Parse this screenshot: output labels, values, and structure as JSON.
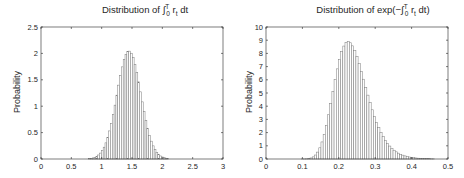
{
  "left": {
    "title_prefix": "Distribution of ",
    "title_integral": "∫",
    "title_sup": "T",
    "title_sub": "0",
    "title_body": " r",
    "title_body_sub": "t",
    "title_suffix": " dt",
    "ylabel": "Probability",
    "xticks": [
      "0",
      "0.5",
      "1",
      "1.5",
      "2",
      "2.5",
      "3"
    ],
    "yticks": [
      "0",
      "0.5",
      "1",
      "1.5",
      "2",
      "2.5"
    ]
  },
  "right": {
    "title_prefix": "Distribution of exp(−",
    "title_integral": "∫",
    "title_sup": "T",
    "title_sub": "0",
    "title_body": " r",
    "title_body_sub": "t",
    "title_suffix": " dt)",
    "ylabel": "Probability",
    "xticks": [
      "0",
      "0.1",
      "0.2",
      "0.3",
      "0.4",
      "0.5"
    ],
    "yticks": [
      "0",
      "1",
      "2",
      "3",
      "4",
      "5",
      "6",
      "7",
      "8",
      "9",
      "10"
    ]
  },
  "colors": {
    "bar_fill": "#ffffff",
    "bar_edge": "#7a7a7a",
    "axis": "#262626",
    "text": "#262626"
  },
  "chart_data": [
    {
      "type": "bar",
      "title": "Distribution of ∫_0^T r_t dt",
      "xlabel": "",
      "ylabel": "Probability",
      "xlim": [
        0,
        3
      ],
      "ylim": [
        0,
        2.5
      ],
      "xticks": [
        0,
        0.5,
        1,
        1.5,
        2,
        2.5,
        3
      ],
      "yticks": [
        0,
        0.5,
        1,
        1.5,
        2,
        2.5
      ],
      "grid": false,
      "legend": null,
      "bin_width": 0.03,
      "x": [
        0.8,
        0.83,
        0.86,
        0.89,
        0.92,
        0.95,
        0.98,
        1.01,
        1.04,
        1.07,
        1.1,
        1.13,
        1.16,
        1.19,
        1.22,
        1.25,
        1.28,
        1.31,
        1.34,
        1.37,
        1.4,
        1.43,
        1.46,
        1.49,
        1.52,
        1.55,
        1.58,
        1.61,
        1.64,
        1.67,
        1.7,
        1.73,
        1.76,
        1.79,
        1.82,
        1.85,
        1.88,
        1.91,
        1.94,
        1.97,
        2.0,
        2.03,
        2.06,
        2.09
      ],
      "values": [
        0.008,
        0.013,
        0.021,
        0.033,
        0.051,
        0.076,
        0.112,
        0.16,
        0.224,
        0.306,
        0.408,
        0.532,
        0.677,
        0.841,
        1.02,
        1.209,
        1.399,
        1.581,
        1.745,
        1.881,
        1.98,
        2.035,
        2.043,
        2.003,
        1.918,
        1.794,
        1.638,
        1.461,
        1.272,
        1.082,
        0.899,
        0.729,
        0.578,
        0.447,
        0.338,
        0.249,
        0.18,
        0.126,
        0.087,
        0.058,
        0.038,
        0.024,
        0.015,
        0.009
      ]
    },
    {
      "type": "bar",
      "title": "Distribution of exp(−∫_0^T r_t dt)",
      "xlabel": "",
      "ylabel": "Probability",
      "xlim": [
        0,
        0.5
      ],
      "ylim": [
        0,
        10
      ],
      "xticks": [
        0,
        0.1,
        0.2,
        0.3,
        0.4,
        0.5
      ],
      "yticks": [
        0,
        1,
        2,
        3,
        4,
        5,
        6,
        7,
        8,
        9,
        10
      ],
      "grid": false,
      "legend": null,
      "bin_width": 0.006,
      "x": [
        0.1,
        0.106,
        0.112,
        0.118,
        0.124,
        0.13,
        0.136,
        0.142,
        0.148,
        0.154,
        0.16,
        0.166,
        0.172,
        0.178,
        0.184,
        0.19,
        0.196,
        0.202,
        0.208,
        0.214,
        0.22,
        0.226,
        0.232,
        0.238,
        0.244,
        0.25,
        0.256,
        0.262,
        0.268,
        0.274,
        0.28,
        0.286,
        0.292,
        0.298,
        0.304,
        0.31,
        0.316,
        0.322,
        0.328,
        0.334,
        0.34,
        0.346,
        0.352,
        0.358,
        0.364,
        0.37,
        0.376,
        0.382,
        0.388,
        0.394,
        0.4,
        0.406,
        0.412,
        0.418,
        0.424,
        0.43,
        0.436,
        0.442,
        0.448,
        0.454,
        0.46
      ],
      "values": [
        0.001,
        0.005,
        0.014,
        0.035,
        0.079,
        0.161,
        0.302,
        0.523,
        0.849,
        1.293,
        1.863,
        2.557,
        3.352,
        4.222,
        5.12,
        6.005,
        6.829,
        7.549,
        8.134,
        8.557,
        8.81,
        8.89,
        8.805,
        8.573,
        8.216,
        7.758,
        7.228,
        6.648,
        6.045,
        5.434,
        4.839,
        4.267,
        3.728,
        3.232,
        2.778,
        2.373,
        2.013,
        1.696,
        1.421,
        1.185,
        0.981,
        0.81,
        0.665,
        0.543,
        0.443,
        0.359,
        0.291,
        0.234,
        0.188,
        0.151,
        0.121,
        0.096,
        0.076,
        0.061,
        0.048,
        0.038,
        0.03,
        0.024,
        0.019,
        0.015,
        0.011
      ]
    }
  ]
}
